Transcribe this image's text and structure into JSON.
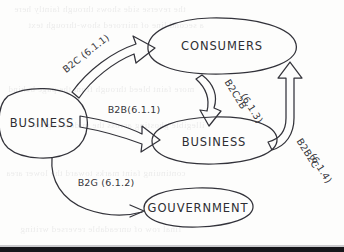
{
  "diagram": {
    "style": "hand-drawn sketch on paper",
    "ink_color": "#33333a",
    "paper_color": "#fdfdfc",
    "nodes": [
      {
        "id": "business-left",
        "label": "BUSINESS"
      },
      {
        "id": "consumers",
        "label": "CONSUMERS"
      },
      {
        "id": "business-right",
        "label": "BUSINESS"
      },
      {
        "id": "gouvernment",
        "label": "GOUVERNMENT"
      }
    ],
    "edges": [
      {
        "id": "b2c",
        "label": "B2C (6.1.1)",
        "from": "business-left",
        "to": "consumers"
      },
      {
        "id": "b2b",
        "label": "B2B(6.1.1)",
        "from": "business-left",
        "to": "business-right"
      },
      {
        "id": "b2g",
        "label": "B2G (6.1.2)",
        "from": "business-left",
        "to": "gouvernment"
      },
      {
        "id": "b2c2b",
        "label": "B2C2B",
        "label_2": "(6.1.3)",
        "from": "consumers",
        "to": "business-right"
      },
      {
        "id": "b2b2c",
        "label": "B2B2C",
        "label_2": "(6.1.4)",
        "from": "business-right",
        "to": "consumers"
      }
    ]
  },
  "background": {
    "ghost_text": [
      "the reverse side shows through faintly here",
      "a second line of mirrored show-through text",
      "more faint bleed through from the page behind",
      "illegible ghosting across the middle region",
      "continuing faint marks toward the lower area",
      "final row of unreadable reversed writing"
    ]
  }
}
